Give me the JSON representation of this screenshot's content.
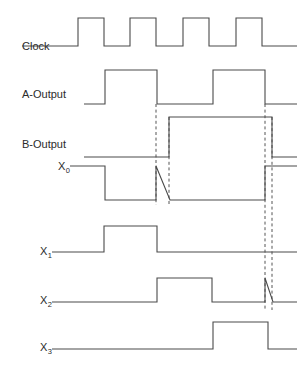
{
  "figure": {
    "type": "timing-diagram",
    "background_color": "#ffffff",
    "stroke_color": "#4a4a4a",
    "marker_color": "#555555",
    "width": 307,
    "height": 371
  },
  "signals": [
    {
      "name": "clock",
      "label": "Clock",
      "label_x": 22,
      "label_y": 50,
      "baseline_y": 46,
      "high_y": 18,
      "path": "M 22,46 L 78,46 L 78,18 L 104,18 L 104,46 L 130,46 L 130,18 L 156,18 L 156,46 L 183,46 L 183,18 L 209,18 L 209,46 L 236,46 L 236,18 L 262,18 L 262,46 L 297,46"
    },
    {
      "name": "a-output",
      "label": "A-Output",
      "label_x": 22,
      "label_y": 98,
      "baseline_y": 104,
      "high_y": 70,
      "path": "M 84,104 L 105,104 L 105,70 L 157,70 L 157,104 L 213,104 L 213,70 L 265,70 L 265,104 L 297,104"
    },
    {
      "name": "b-output",
      "label": "B-Output",
      "label_x": 22,
      "label_y": 148,
      "baseline_y": 157,
      "high_y": 117,
      "path": "M 84,157 L 169,157 L 169,117 L 272,117 L 272,157 L 297,157"
    },
    {
      "name": "x0",
      "label": "X",
      "sub": "0",
      "label_x": 58,
      "label_y": 170,
      "baseline_y": 200,
      "high_y": 166,
      "path": "M 70,166 L 105,166 L 105,200 L 156,200 L 156,166 L 170,200 L 265,200 L 265,166 L 297,166"
    },
    {
      "name": "x1",
      "label": "X",
      "sub": "1",
      "label_x": 40,
      "label_y": 255,
      "baseline_y": 252,
      "high_y": 226,
      "path": "M 52,252 L 104,252 L 104,226 L 157,226 L 157,252 L 297,252"
    },
    {
      "name": "x2",
      "label": "X",
      "sub": "2",
      "label_x": 40,
      "label_y": 304,
      "baseline_y": 302,
      "high_y": 278,
      "path": "M 52,302 L 157,302 L 157,278 L 212,278 L 212,302 L 265,302 L 265,278 L 273,302 L 297,302"
    },
    {
      "name": "x3",
      "label": "X",
      "sub": "3",
      "label_x": 40,
      "label_y": 351,
      "baseline_y": 349,
      "high_y": 322,
      "path": "M 52,349 L 213,349 L 213,322 L 268,322 L 268,349 L 297,349"
    }
  ],
  "markers": [
    {
      "name": "marker-a-fall",
      "x": 156,
      "y1": 104,
      "y2": 205
    },
    {
      "name": "marker-b-rise",
      "x": 169,
      "y1": 117,
      "y2": 205
    },
    {
      "name": "marker-a-fall-2",
      "x": 265,
      "y1": 104,
      "y2": 310
    },
    {
      "name": "marker-b-fall",
      "x": 272,
      "y1": 117,
      "y2": 310
    }
  ]
}
